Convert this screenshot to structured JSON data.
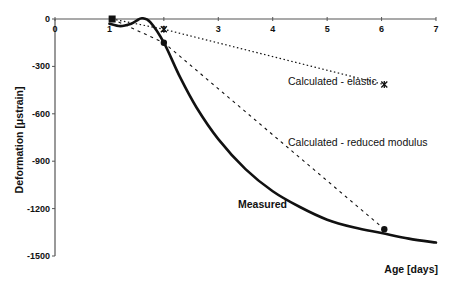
{
  "chart_data": {
    "type": "line",
    "title": "",
    "xlabel": "Age [days]",
    "ylabel": "Deformation [μstrain]",
    "xlim": [
      0,
      7
    ],
    "ylim": [
      -1500,
      0
    ],
    "x_ticks": [
      0,
      1,
      2,
      3,
      4,
      5,
      6,
      7
    ],
    "y_ticks": [
      0,
      -300,
      -600,
      -900,
      -1200,
      -1500
    ],
    "grid": false,
    "legend": "none (inline annotations)",
    "series": [
      {
        "name": "Calculated - elastic",
        "style": "dotted",
        "marker": "asterisk",
        "points": [
          [
            1.05,
            0
          ],
          [
            2.0,
            -65
          ],
          [
            6.05,
            -415
          ]
        ]
      },
      {
        "name": "Calculated - reduced modulus",
        "style": "dashed",
        "marker": "circle",
        "points": [
          [
            1.05,
            0
          ],
          [
            2.0,
            -150
          ],
          [
            6.05,
            -1330
          ]
        ]
      },
      {
        "name": "Measured",
        "style": "solid-thick",
        "marker": "none",
        "points": [
          [
            1.0,
            -30
          ],
          [
            1.2,
            -45
          ],
          [
            1.4,
            -30
          ],
          [
            1.5,
            -10
          ],
          [
            1.6,
            5
          ],
          [
            1.75,
            -20
          ],
          [
            2.0,
            -150
          ],
          [
            2.3,
            -370
          ],
          [
            2.6,
            -560
          ],
          [
            3.0,
            -760
          ],
          [
            3.5,
            -950
          ],
          [
            4.0,
            -1090
          ],
          [
            4.5,
            -1190
          ],
          [
            5.0,
            -1270
          ],
          [
            5.5,
            -1320
          ],
          [
            6.0,
            -1355
          ],
          [
            6.5,
            -1390
          ],
          [
            7.0,
            -1415
          ]
        ]
      }
    ],
    "start_marker": {
      "shape": "square",
      "point": [
        1.05,
        0
      ]
    },
    "annotations": [
      {
        "text": "Calculated - elastic",
        "x": 4.3,
        "y": -380
      },
      {
        "text": "Calculated - reduced modulus",
        "x": 4.3,
        "y": -770
      },
      {
        "text": "Measured",
        "x": 3.35,
        "y": -1190
      }
    ]
  },
  "labels": {
    "xlabel": "Age [days]",
    "ylabel": "Deformation [μstrain]",
    "elastic": "Calculated - elastic",
    "reduced": "Calculated - reduced modulus",
    "measured": "Measured"
  }
}
